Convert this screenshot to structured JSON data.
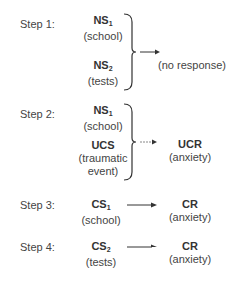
{
  "steps": [
    {
      "label": "Step 1:",
      "stimuli": [
        {
          "code": "NS",
          "sub": "1",
          "desc": "(school)"
        },
        {
          "code": "NS",
          "sub": "2",
          "desc": "(tests)"
        }
      ],
      "response": {
        "code": "",
        "desc": "(no response)"
      }
    },
    {
      "label": "Step 2:",
      "stimuli": [
        {
          "code": "NS",
          "sub": "1",
          "desc": "(school)"
        },
        {
          "code": "UCS",
          "sub": "",
          "desc1": "(traumatic",
          "desc2": "event)"
        }
      ],
      "response": {
        "code": "UCR",
        "desc": "(anxiety)"
      }
    },
    {
      "label": "Step 3:",
      "stimuli": [
        {
          "code": "CS",
          "sub": "1",
          "desc": "(school)"
        }
      ],
      "response": {
        "code": "CR",
        "desc": "(anxiety)"
      }
    },
    {
      "label": "Step 4:",
      "stimuli": [
        {
          "code": "CS",
          "sub": "2",
          "desc": "(tests)"
        }
      ],
      "response": {
        "code": "CR",
        "desc": "(anxiety)"
      }
    }
  ]
}
